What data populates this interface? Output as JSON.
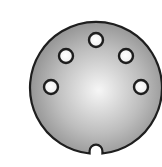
{
  "figure": {
    "pin_count": 5,
    "colors": {
      "background": "#ffffff",
      "face_light": "#f4f4f4",
      "face_dark": "#8a8a8a",
      "outline": "#222222",
      "pin_hole": "#ffffff"
    }
  }
}
